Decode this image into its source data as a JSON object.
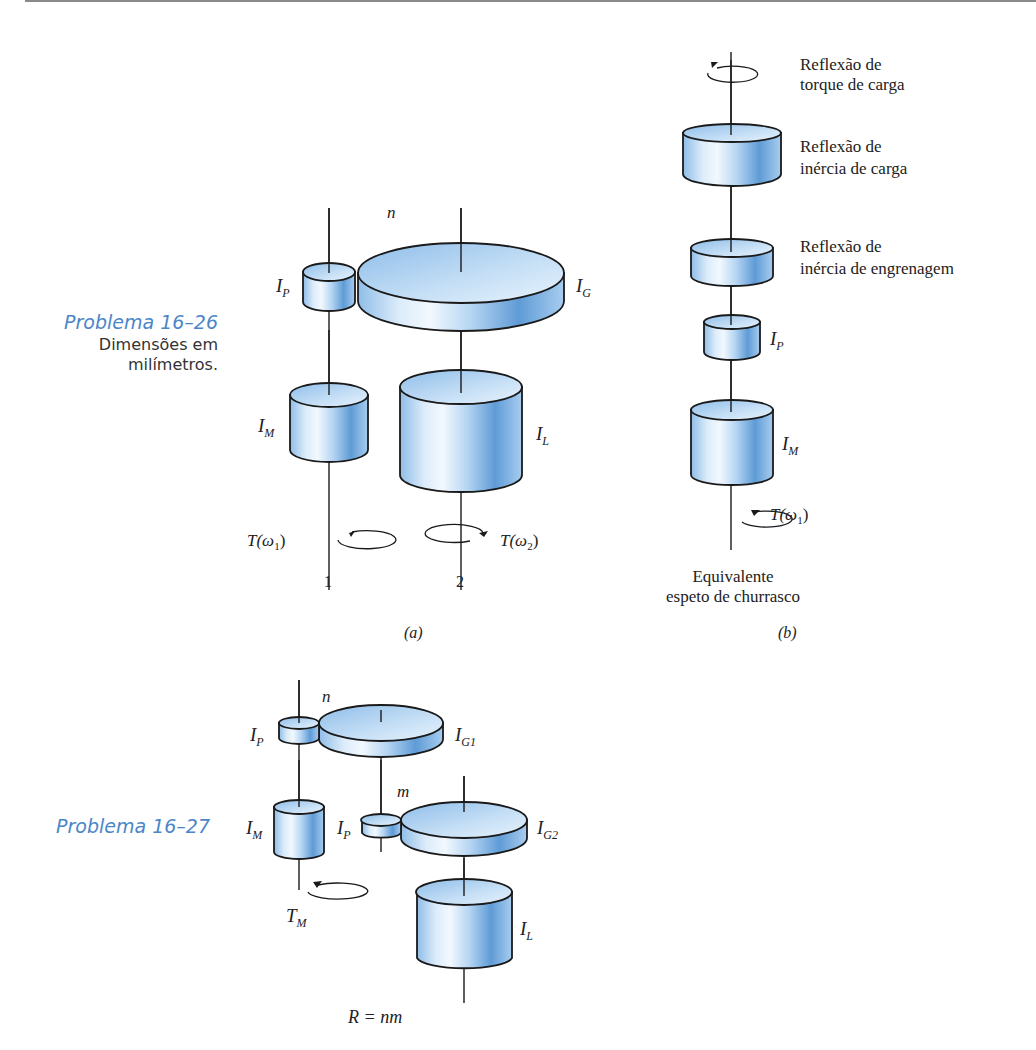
{
  "problems": [
    {
      "title": "Problema 16–26",
      "subtitle_line1": "Dimensões em",
      "subtitle_line2": "milímetros."
    },
    {
      "title": "Problema 16–27"
    }
  ],
  "figure_a": {
    "caption": "(a)",
    "labels": {
      "ratio": "n",
      "pinion": "I",
      "pinion_sub": "P",
      "gear": "I",
      "gear_sub": "G",
      "motor": "I",
      "motor_sub": "M",
      "load": "I",
      "load_sub": "L",
      "torque1": "T(ω",
      "torque1_sub": "1",
      "torque2": "T(ω",
      "torque2_sub": "2",
      "shaft1": "1",
      "shaft2": "2"
    }
  },
  "figure_b": {
    "caption": "(b)",
    "labels": {
      "load_torque_reflection_1": "Reflexão de",
      "load_torque_reflection_2": "torque de carga",
      "load_inertia_reflection_1": "Reflexão de",
      "load_inertia_reflection_2": "inércia de carga",
      "gear_inertia_reflection_1": "Reflexão de",
      "gear_inertia_reflection_2": "inércia de engrenagem",
      "pinion": "I",
      "pinion_sub": "P",
      "motor": "I",
      "motor_sub": "M",
      "torque": "T(ω",
      "torque_sub": "1",
      "equivalent_1": "Equivalente",
      "equivalent_2": "espeto de churrasco"
    }
  },
  "figure_c": {
    "labels": {
      "ratio_n": "n",
      "ratio_m": "m",
      "pinion1": "I",
      "pinion1_sub": "P",
      "gear1": "I",
      "gear1_sub": "G1",
      "pinion2": "I",
      "pinion2_sub": "P",
      "gear2": "I",
      "gear2_sub": "G2",
      "motor": "I",
      "motor_sub": "M",
      "load": "I",
      "load_sub": "L",
      "torque": "T",
      "torque_sub": "M",
      "relation": "R = nm"
    }
  },
  "colors": {
    "problem_title": "#4a86c8",
    "cylinder_light": "#e6f2fc",
    "cylinder_mid": "#a9cdef",
    "cylinder_dark": "#5c9ad8",
    "outline": "#1a1a1a"
  }
}
